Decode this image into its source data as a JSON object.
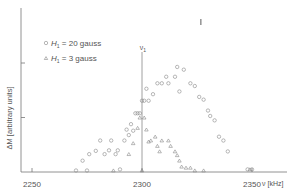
{
  "chart_data": {
    "type": "scatter",
    "title": "",
    "xlabel": "ν [kHz]",
    "ylabel": "ΔM [arbitrary units]",
    "xlim": [
      2237,
      2366
    ],
    "ylim": [
      0,
      2.9
    ],
    "x_ticks": [
      2250,
      2300,
      2350
    ],
    "x_tick_labels": [
      "2250",
      "2300",
      "2350"
    ],
    "y_ticks": [
      1,
      2
    ],
    "grid": false,
    "legend_position": "upper-left",
    "annotations": [
      {
        "text": "ν1",
        "x": 2300,
        "note": "vertical marker line at ν1"
      },
      {
        "text": "marker",
        "x": 2327,
        "y": 2.75,
        "note": "small vertical mark near top"
      }
    ],
    "series": [
      {
        "name": "H1 = 20 gauss",
        "marker": "circle",
        "points": [
          [
            2270,
            0.0
          ],
          [
            2275,
            0.0
          ],
          [
            2290,
            0.02
          ],
          [
            2273,
            0.18
          ],
          [
            2276,
            0.3
          ],
          [
            2279,
            0.36
          ],
          [
            2281,
            0.55
          ],
          [
            2283,
            0.3
          ],
          [
            2285,
            0.37
          ],
          [
            2286,
            0.55
          ],
          [
            2288,
            0.3
          ],
          [
            2289,
            0.37
          ],
          [
            2292,
            0.55
          ],
          [
            2293,
            0.75
          ],
          [
            2294,
            0.65
          ],
          [
            2295,
            0.85
          ],
          [
            2296,
            0.73
          ],
          [
            2297,
            1.05
          ],
          [
            2298,
            1.05
          ],
          [
            2299,
            1.05
          ],
          [
            2300,
            1.28
          ],
          [
            2301,
            1.28
          ],
          [
            2302,
            1.5
          ],
          [
            2303,
            1.28
          ],
          [
            2305,
            1.4
          ],
          [
            2307,
            1.6
          ],
          [
            2309,
            1.6
          ],
          [
            2311,
            1.72
          ],
          [
            2312,
            1.6
          ],
          [
            2315,
            1.72
          ],
          [
            2316,
            1.9
          ],
          [
            2317,
            1.45
          ],
          [
            2319,
            1.85
          ],
          [
            2322,
            1.6
          ],
          [
            2324,
            1.55
          ],
          [
            2326,
            1.35
          ],
          [
            2328,
            1.3
          ],
          [
            2330,
            1.1
          ],
          [
            2331,
            1.0
          ],
          [
            2333,
            0.92
          ],
          [
            2335,
            0.62
          ],
          [
            2337,
            0.55
          ],
          [
            2339,
            0.35
          ],
          [
            2348,
            0.02
          ],
          [
            2350,
            0.02
          ]
        ]
      },
      {
        "name": "H1 = 3 gauss",
        "marker": "triangle",
        "points": [
          [
            2287,
            0.0
          ],
          [
            2294,
            0.3
          ],
          [
            2296,
            0.5
          ],
          [
            2298,
            0.78
          ],
          [
            2299,
            0.97
          ],
          [
            2300,
            0.0
          ],
          [
            2301,
            0.97
          ],
          [
            2302,
            0.75
          ],
          [
            2303,
            0.53
          ],
          [
            2304,
            0.55
          ],
          [
            2306,
            0.62
          ],
          [
            2307,
            0.45
          ],
          [
            2308,
            0.35
          ],
          [
            2309,
            0.55
          ],
          [
            2312,
            0.55
          ],
          [
            2313,
            0.45
          ],
          [
            2315,
            0.35
          ],
          [
            2316,
            0.28
          ],
          [
            2317,
            0.18
          ],
          [
            2318,
            0.07
          ],
          [
            2320,
            0.05
          ],
          [
            2322,
            0.05
          ],
          [
            2324,
            0.0
          ],
          [
            2328,
            0.0
          ],
          [
            2349,
            0.02
          ]
        ]
      }
    ]
  },
  "axes": {
    "ylabel": "ΔM [arbitrary units]",
    "xlabel": "ν [kHz]",
    "x_tick_labels": [
      "2250",
      "2300",
      "2350"
    ]
  },
  "legend": {
    "items": [
      {
        "symbol": "○",
        "label_prefix": "H",
        "label_sub": "1",
        "label_rest": " = 20 gauss"
      },
      {
        "symbol": "△",
        "label_prefix": "H",
        "label_sub": "1",
        "label_rest": " = 3 gauss"
      }
    ]
  },
  "marker_label": {
    "text": "ν",
    "sub": "1"
  }
}
